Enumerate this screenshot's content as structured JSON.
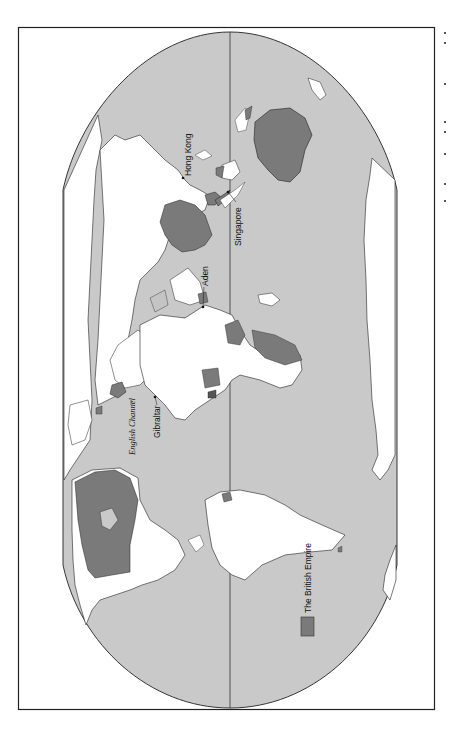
{
  "map": {
    "title": "The British Empire",
    "orientation": "rotated 90° counter-clockwise (north to the left)",
    "projection": "flat-polar oval world map",
    "legend": {
      "label": "The British Empire",
      "swatch_color": "#7a7a7a"
    },
    "labels": {
      "hong_kong": "Hong Kong",
      "singapore": "Singapore",
      "aden": "Aden",
      "gibraltar": "Gibraltar",
      "english_channel": "English Channel"
    },
    "colors": {
      "ocean": "#c9c9c9",
      "land": "#ffffff",
      "empire": "#7a7a7a",
      "other_empire_light": "#c4c4c4",
      "border": "#222222",
      "page": "#ffffff"
    }
  }
}
